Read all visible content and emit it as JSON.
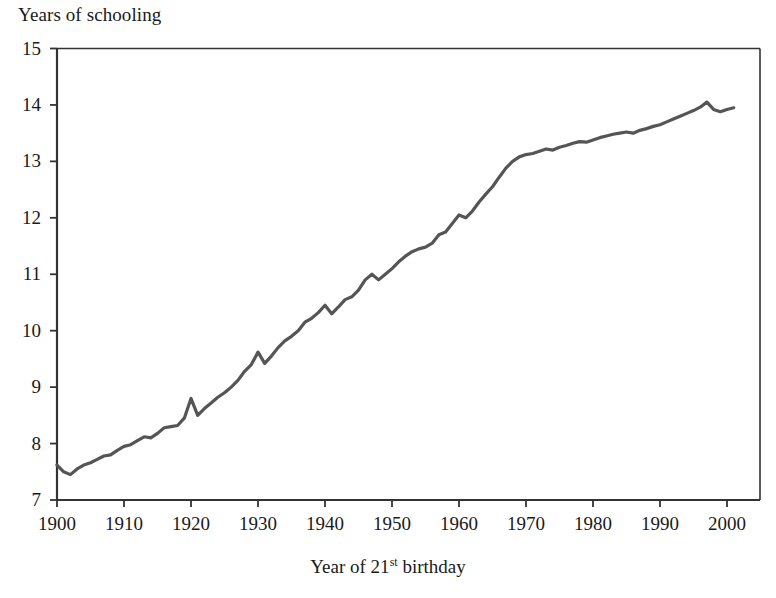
{
  "chart_data": {
    "type": "line",
    "title": "",
    "ylabel": "Years of schooling",
    "xlabel": "Year of 21st birthday",
    "xlabel_parts": {
      "pre": "Year of 21",
      "sup": "st",
      "post": " birthday"
    },
    "xlim": [
      1900,
      2001
    ],
    "ylim": [
      7,
      15
    ],
    "ytick_labels": [
      "15",
      "14",
      "13",
      "12",
      "11",
      "10",
      "9",
      "8",
      "7"
    ],
    "yticks": [
      15,
      14,
      13,
      12,
      11,
      10,
      9,
      8,
      7
    ],
    "xtick_labels": [
      "1900",
      "1910",
      "1920",
      "1930",
      "1940",
      "1950",
      "1960",
      "1970",
      "1980",
      "1990",
      "2000"
    ],
    "xticks": [
      1900,
      1910,
      1920,
      1930,
      1940,
      1950,
      1960,
      1970,
      1980,
      1990,
      2000
    ],
    "grid": false,
    "legend": "none",
    "line_color": "#555555",
    "axis_color": "#333333",
    "series": [
      {
        "name": "Years of schooling",
        "x": [
          1900,
          1901,
          1902,
          1903,
          1904,
          1905,
          1906,
          1907,
          1908,
          1909,
          1910,
          1911,
          1912,
          1913,
          1914,
          1915,
          1916,
          1917,
          1918,
          1919,
          1920,
          1921,
          1922,
          1923,
          1924,
          1925,
          1926,
          1927,
          1928,
          1929,
          1930,
          1931,
          1932,
          1933,
          1934,
          1935,
          1936,
          1937,
          1938,
          1939,
          1940,
          1941,
          1942,
          1943,
          1944,
          1945,
          1946,
          1947,
          1948,
          1949,
          1950,
          1951,
          1952,
          1953,
          1954,
          1955,
          1956,
          1957,
          1958,
          1959,
          1960,
          1961,
          1962,
          1963,
          1964,
          1965,
          1966,
          1967,
          1968,
          1969,
          1970,
          1971,
          1972,
          1973,
          1974,
          1975,
          1976,
          1977,
          1978,
          1979,
          1980,
          1981,
          1982,
          1983,
          1984,
          1985,
          1986,
          1987,
          1988,
          1989,
          1990,
          1991,
          1992,
          1993,
          1994,
          1995,
          1996,
          1997,
          1998,
          1999,
          2000,
          2001
        ],
        "values": [
          7.62,
          7.5,
          7.45,
          7.55,
          7.62,
          7.66,
          7.72,
          7.78,
          7.8,
          7.88,
          7.95,
          7.98,
          8.05,
          8.12,
          8.1,
          8.18,
          8.28,
          8.3,
          8.32,
          8.45,
          8.8,
          8.5,
          8.62,
          8.72,
          8.82,
          8.9,
          9.0,
          9.12,
          9.28,
          9.4,
          9.62,
          9.42,
          9.55,
          9.7,
          9.82,
          9.9,
          10.0,
          10.15,
          10.22,
          10.32,
          10.45,
          10.3,
          10.42,
          10.55,
          10.6,
          10.72,
          10.9,
          11.0,
          10.9,
          11.0,
          11.1,
          11.22,
          11.32,
          11.4,
          11.45,
          11.48,
          11.55,
          11.7,
          11.75,
          11.9,
          12.05,
          12.0,
          12.12,
          12.28,
          12.42,
          12.55,
          12.72,
          12.88,
          13.0,
          13.08,
          13.12,
          13.14,
          13.18,
          13.22,
          13.2,
          13.25,
          13.28,
          13.32,
          13.35,
          13.34,
          13.38,
          13.42,
          13.45,
          13.48,
          13.5,
          13.52,
          13.5,
          13.55,
          13.58,
          13.62,
          13.65,
          13.7,
          13.75,
          13.8,
          13.85,
          13.9,
          13.96,
          14.05,
          13.92,
          13.88,
          13.92,
          13.95
        ]
      }
    ]
  },
  "axes": {
    "frame_color": "#333333"
  }
}
